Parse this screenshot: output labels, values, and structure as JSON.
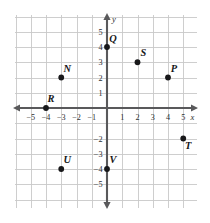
{
  "figure": {
    "kind": "coordinate-plane",
    "title": "",
    "x_axis_name": "x",
    "y_axis_name": "y"
  },
  "chart_data": {
    "type": "scatter",
    "title": "",
    "xlabel": "x",
    "ylabel": "y",
    "xlim": [
      -5.6,
      5.6
    ],
    "ylim": [
      -5.6,
      5.6
    ],
    "grid": true,
    "legend": "none",
    "x_ticks": [
      "−5",
      "−4",
      "−3",
      "−2",
      "−1",
      "1",
      "2",
      "3",
      "4",
      "5"
    ],
    "x_tick_values": [
      -5,
      -4,
      -3,
      -2,
      -1,
      1,
      2,
      3,
      4,
      5
    ],
    "y_ticks": [
      "5",
      "4",
      "3",
      "2",
      "1",
      "−2",
      "−3",
      "−4",
      "−5"
    ],
    "y_tick_values": [
      5,
      4,
      3,
      2,
      1,
      -2,
      -3,
      -4,
      -5
    ],
    "points": [
      {
        "label": "Q",
        "x": 0,
        "y": 4,
        "label_dx": 6,
        "label_dy": -5
      },
      {
        "label": "S",
        "x": 2,
        "y": 3,
        "label_dx": 6,
        "label_dy": -6
      },
      {
        "label": "P",
        "x": 4,
        "y": 2,
        "label_dx": 6,
        "label_dy": -6
      },
      {
        "label": "N",
        "x": -3,
        "y": 2,
        "label_dx": 6,
        "label_dy": -6
      },
      {
        "label": "R",
        "x": -4,
        "y": 0,
        "label_dx": 5,
        "label_dy": -6
      },
      {
        "label": "T",
        "x": 5,
        "y": -2,
        "label_dx": 5,
        "label_dy": 10
      },
      {
        "label": "V",
        "x": 0,
        "y": -4,
        "label_dx": 6,
        "label_dy": -6
      },
      {
        "label": "U",
        "x": -3,
        "y": -4,
        "label_dx": 6,
        "label_dy": -6
      }
    ]
  },
  "colors": {
    "grid": "#c9c9c9",
    "axis": "#59595b",
    "point": "#18181a",
    "text": "#2e2e30",
    "background": "#ffffff"
  }
}
